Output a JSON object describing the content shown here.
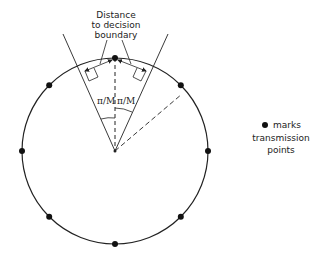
{
  "diagram": {
    "title_annotation": [
      "Distance",
      "to decision",
      "boundary"
    ],
    "angle_label_left": "π/M",
    "angle_label_right": "π/M",
    "legend": {
      "symbol": "filled-dot",
      "lines": [
        "marks",
        "transmission",
        "points"
      ]
    },
    "constellation": {
      "type": "PSK",
      "point_count": 8,
      "point_angles_deg": [
        90,
        45,
        0,
        -45,
        -90,
        -135,
        180,
        135
      ]
    },
    "colors": {
      "stroke": "#222222",
      "point": "#111111",
      "background": "#ffffff"
    }
  }
}
